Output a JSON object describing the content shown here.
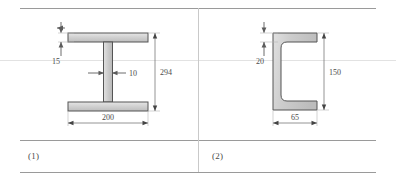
{
  "figure_table": {
    "columns": [
      {
        "caption": "(1)",
        "section_type": "i-beam",
        "dimensions": [
          {
            "name": "flange-thickness",
            "value": "15"
          },
          {
            "name": "web-thickness",
            "value": "10"
          },
          {
            "name": "overall-height",
            "value": "294"
          },
          {
            "name": "flange-width",
            "value": "200"
          }
        ]
      },
      {
        "caption": "(2)",
        "section_type": "channel",
        "dimensions": [
          {
            "name": "flange-thickness",
            "value": "20"
          },
          {
            "name": "overall-height",
            "value": "150"
          },
          {
            "name": "flange-width",
            "value": "65"
          }
        ]
      }
    ]
  },
  "colors": {
    "section_fill": "#c8c8c8",
    "section_fill_light": "#dcdcdc",
    "section_stroke": "#555555",
    "dimension_line": "#6b6b6b",
    "rule": "#9a9a9a",
    "rule_faint": "#e2e2e2",
    "divider": "#c9c9c9",
    "text": "#4a4a4a"
  }
}
